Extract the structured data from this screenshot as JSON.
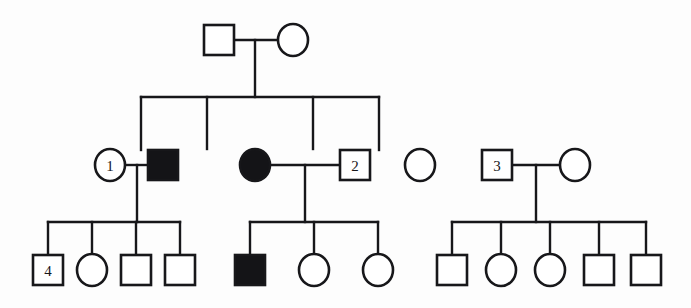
{
  "figure": {
    "kind": "pedigree-chart",
    "width": 691,
    "height": 308,
    "background_color": "#fdfdfd",
    "line_color": "#17171a",
    "affected_fill_color": "#141417",
    "unaffected_fill_color": "#ffffff"
  },
  "legend_semantics": {
    "square": "male",
    "circle": "female",
    "filled": "affected",
    "open": "unaffected",
    "horizontal_line_between_symbols": "mating/marriage line",
    "vertical_line_down": "line of descent",
    "horizontal_sibship_bar": "sibship line"
  },
  "generations": [
    {
      "id": "I",
      "y": 40,
      "individuals": [
        {
          "id": "I-1",
          "shape": "square",
          "sex": "male",
          "affected": false,
          "label": "",
          "cx": 219,
          "cy": 40
        },
        {
          "id": "I-2",
          "shape": "circle",
          "sex": "female",
          "affected": false,
          "label": "",
          "cx": 293,
          "cy": 40
        }
      ],
      "matings": [
        {
          "id": "mating-I",
          "left": "I-1",
          "right": "I-2",
          "y": 40,
          "x1": 235,
          "x2": 277,
          "descent_x": 255,
          "descent_y_end": 97
        }
      ]
    },
    {
      "id": "II",
      "y": 165,
      "individuals": [
        {
          "id": "II-1",
          "shape": "circle",
          "sex": "female",
          "affected": false,
          "label": "1",
          "cx": 110,
          "cy": 165
        },
        {
          "id": "II-2",
          "shape": "square",
          "sex": "male",
          "affected": true,
          "label": "",
          "cx": 163,
          "cy": 165
        },
        {
          "id": "II-3",
          "shape": "circle",
          "sex": "female",
          "affected": true,
          "label": "",
          "cx": 255,
          "cy": 165
        },
        {
          "id": "II-4",
          "shape": "square",
          "sex": "male",
          "affected": false,
          "label": "2",
          "cx": 355,
          "cy": 165
        },
        {
          "id": "II-5",
          "shape": "circle",
          "sex": "female",
          "affected": false,
          "label": "",
          "cx": 420,
          "cy": 165
        },
        {
          "id": "II-6",
          "shape": "square",
          "sex": "male",
          "affected": false,
          "label": "3",
          "cx": 497,
          "cy": 165
        },
        {
          "id": "II-7",
          "shape": "circle",
          "sex": "female",
          "affected": false,
          "label": "",
          "cx": 575,
          "cy": 165
        }
      ],
      "sibship_bar": {
        "y": 97,
        "x1": 141,
        "x2": 379,
        "child_drop_x": [
          141,
          207,
          313,
          379
        ]
      },
      "child_symbol_ids": [
        "II-2",
        "II-3",
        "II-5",
        "II-6"
      ],
      "matings": [
        {
          "id": "mating-II-a",
          "left": "II-1",
          "right": "II-2",
          "y": 165,
          "x1": 126,
          "x2": 147,
          "descent_x": 137,
          "descent_y_end": 222
        },
        {
          "id": "mating-II-b",
          "left": "II-3",
          "right": "II-4",
          "y": 165,
          "x1": 271,
          "x2": 339,
          "descent_x": 305,
          "descent_y_end": 222
        },
        {
          "id": "mating-II-c",
          "left": "II-6",
          "right": "II-7",
          "y": 165,
          "x1": 513,
          "x2": 559,
          "descent_x": 536,
          "descent_y_end": 222
        }
      ]
    },
    {
      "id": "III",
      "y": 270,
      "sibships": [
        {
          "id": "sibship-III-a",
          "parents": [
            "II-1",
            "II-2"
          ],
          "bar": {
            "y": 222,
            "x1": 48,
            "x2": 180
          },
          "individuals": [
            {
              "id": "III-1",
              "shape": "square",
              "sex": "male",
              "affected": false,
              "label": "4",
              "cx": 48,
              "cy": 270
            },
            {
              "id": "III-2",
              "shape": "circle",
              "sex": "female",
              "affected": false,
              "label": "",
              "cx": 92,
              "cy": 270
            },
            {
              "id": "III-3",
              "shape": "square",
              "sex": "male",
              "affected": false,
              "label": "",
              "cx": 136,
              "cy": 270
            },
            {
              "id": "III-4",
              "shape": "square",
              "sex": "male",
              "affected": false,
              "label": "",
              "cx": 180,
              "cy": 270
            }
          ]
        },
        {
          "id": "sibship-III-b",
          "parents": [
            "II-3",
            "II-4"
          ],
          "bar": {
            "y": 222,
            "x1": 250,
            "x2": 378
          },
          "individuals": [
            {
              "id": "III-5",
              "shape": "square",
              "sex": "male",
              "affected": true,
              "label": "",
              "cx": 250,
              "cy": 270
            },
            {
              "id": "III-6",
              "shape": "circle",
              "sex": "female",
              "affected": false,
              "label": "",
              "cx": 314,
              "cy": 270
            },
            {
              "id": "III-7",
              "shape": "circle",
              "sex": "female",
              "affected": false,
              "label": "",
              "cx": 378,
              "cy": 270
            }
          ]
        },
        {
          "id": "sibship-III-c",
          "parents": [
            "II-6",
            "II-7"
          ],
          "bar": {
            "y": 222,
            "x1": 452,
            "x2": 646
          },
          "individuals": [
            {
              "id": "III-8",
              "shape": "square",
              "sex": "male",
              "affected": false,
              "label": "",
              "cx": 452,
              "cy": 270
            },
            {
              "id": "III-9",
              "shape": "circle",
              "sex": "female",
              "affected": false,
              "label": "",
              "cx": 501,
              "cy": 270
            },
            {
              "id": "III-10",
              "shape": "circle",
              "sex": "female",
              "affected": false,
              "label": "",
              "cx": 550,
              "cy": 270
            },
            {
              "id": "III-11",
              "shape": "square",
              "sex": "male",
              "affected": false,
              "label": "",
              "cx": 599,
              "cy": 270
            },
            {
              "id": "III-12",
              "shape": "square",
              "sex": "male",
              "affected": false,
              "label": "",
              "cx": 646,
              "cy": 270
            }
          ]
        }
      ]
    }
  ],
  "counts": {
    "total_individuals": 21,
    "affected_individuals": 3,
    "numbered_individuals": [
      "1",
      "2",
      "3",
      "4"
    ]
  }
}
